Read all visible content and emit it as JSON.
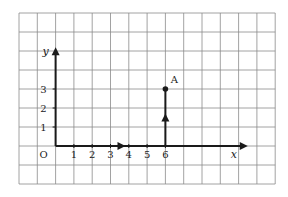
{
  "diagram": {
    "type": "coordinate-grid",
    "grid": {
      "columns": 14,
      "rows": 9,
      "left": 19,
      "top": 13,
      "cell_w": 18.3,
      "cell_h": 19,
      "line_color": "#8a8a8a"
    },
    "origin": {
      "label": "O",
      "col": 2,
      "row": 7
    },
    "x_axis": {
      "label": "x",
      "ticks": [
        "1",
        "2",
        "3",
        "4",
        "5",
        "6"
      ],
      "arrow_mid_at": 3.6,
      "end_col_offset": 10.5
    },
    "y_axis": {
      "label": "y",
      "ticks": [
        "1",
        "2",
        "3"
      ],
      "end_row_offset": 5.2
    },
    "point": {
      "label": "A",
      "x": 6,
      "y": 3
    },
    "segments": [
      {
        "from": [
          0,
          0
        ],
        "to": [
          6,
          0
        ],
        "note": "move 6 right"
      },
      {
        "from": [
          6,
          0
        ],
        "to": [
          6,
          3
        ],
        "note": "move 3 up"
      }
    ],
    "colors": {
      "axis": "#1a1a1a",
      "grid": "#8a8a8a",
      "text": "#222222"
    }
  }
}
